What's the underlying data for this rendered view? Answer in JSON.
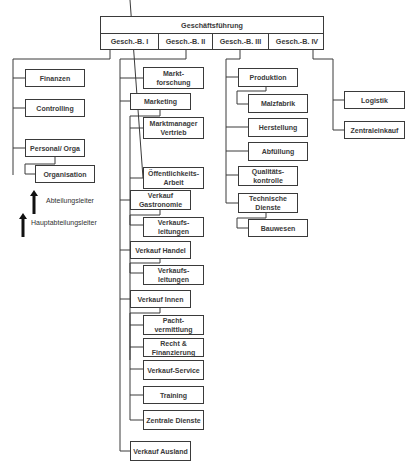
{
  "header": {
    "title": "Geschäftsführung",
    "divisions": [
      "Gesch.-B. I",
      "Gesch.-B. II",
      "Gesch.-B. III",
      "Gesch.-B. IV"
    ]
  },
  "division_1": {
    "units": [
      "Finanzen",
      "Controlling",
      "Personal/ Orga"
    ],
    "sub_units": [
      "Organisation"
    ]
  },
  "division_2": {
    "marktforschung": "Markt-\nforschung",
    "marketing": "Marketing",
    "marketing_subs": [
      "Marktmanager Vertrieb",
      "Öffentlichkeits-Arbeit"
    ],
    "verkauf_gastronomie": "Verkauf Gastronomie",
    "verkauf_gastronomie_subs": [
      "Verkaufs-leitungen"
    ],
    "verkauf_handel": "Verkauf Handel",
    "verkauf_handel_subs": [
      "Verkaufs-leitungen"
    ],
    "verkauf_innen": "Verkauf Innen",
    "verkauf_innen_subs": [
      "Pacht-vermittlung",
      "Recht & Finanzierung",
      "Verkauf-Service",
      "Training",
      "Zentrale Dienste"
    ],
    "verkauf_ausland": "Verkauf Ausland"
  },
  "division_3": {
    "produktion": "Produktion",
    "produktion_subs": [
      "Malzfabrik"
    ],
    "units": [
      "Herstellung",
      "Abfüllung",
      "Qualitäts-kontrolle"
    ],
    "technische_dienste": "Technische Dienste",
    "technische_dienste_subs": [
      "Bauwesen"
    ]
  },
  "division_4": {
    "units": [
      "Logistik",
      "Zentraleinkauf"
    ]
  },
  "legend": {
    "abteilungsleiter": "Abteilungsleiter",
    "hauptabteilungsleiter": "Hauptabteilungsleiter"
  },
  "colors": {
    "line": "#3a3a3a",
    "text": "#3a3a3a",
    "background": "#ffffff"
  }
}
